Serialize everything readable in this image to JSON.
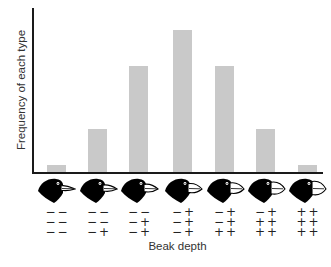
{
  "chart_data": {
    "type": "bar",
    "title": "",
    "xlabel": "Beak depth",
    "ylabel": "Frequency of each type",
    "categories": [
      "0 +",
      "1 +",
      "2 +",
      "3 +",
      "4 +",
      "5 +",
      "6 +"
    ],
    "genotypes": [
      [
        [
          "−",
          "−"
        ],
        [
          "−",
          "−"
        ],
        [
          "−",
          "−"
        ]
      ],
      [
        [
          "−",
          "−"
        ],
        [
          "−",
          "−"
        ],
        [
          "−",
          "+"
        ]
      ],
      [
        [
          "−",
          "−"
        ],
        [
          "−",
          "+"
        ],
        [
          "−",
          "+"
        ]
      ],
      [
        [
          "−",
          "+"
        ],
        [
          "−",
          "+"
        ],
        [
          "−",
          "+"
        ]
      ],
      [
        [
          "−",
          "+"
        ],
        [
          "−",
          "+"
        ],
        [
          "+",
          "+"
        ]
      ],
      [
        [
          "−",
          "+"
        ],
        [
          "+",
          "+"
        ],
        [
          "+",
          "+"
        ]
      ],
      [
        [
          "+",
          "+"
        ],
        [
          "+",
          "+"
        ],
        [
          "+",
          "+"
        ]
      ]
    ],
    "values": [
      1,
      6,
      15,
      20,
      15,
      6,
      1
    ],
    "ylim": [
      0,
      23
    ],
    "grid": false,
    "legend": null,
    "y_tick_labels": [],
    "bar_color": "#c9c9c9",
    "category_icons": "finch-head with beak depth increasing left to right"
  },
  "labels": {
    "ylabel": "Frequency of each type",
    "xlabel": "Beak depth"
  }
}
